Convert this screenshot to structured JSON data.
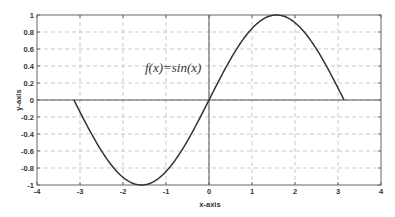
{
  "chart_data": {
    "type": "line",
    "title": "",
    "xlabel": "x-axis",
    "ylabel": "y-axis",
    "xlim": [
      -4,
      4
    ],
    "ylim": [
      -1,
      1
    ],
    "xticks": [
      -4,
      -3,
      -2,
      -1,
      0,
      1,
      2,
      3,
      4
    ],
    "xtick_labels": [
      "-4",
      "-3",
      "-2",
      "-1",
      "0",
      "1",
      "2",
      "3",
      "4"
    ],
    "yticks": [
      -1,
      -0.8,
      -0.6,
      -0.4,
      -0.2,
      0,
      0.2,
      0.4,
      0.6,
      0.8,
      1
    ],
    "ytick_labels": [
      "-1",
      "-0.8",
      "-0.6",
      "-0.4",
      "-0.2",
      "0",
      "0.2",
      "0.4",
      "0.6",
      "0.8",
      "1"
    ],
    "grid": true,
    "grid_style": "dashed",
    "legend": null,
    "annotations": [
      {
        "text": "f(x)=sin(x)",
        "x": -1.5,
        "y": 0.55
      }
    ],
    "series": [
      {
        "name": "f(x)=sin(x)",
        "function": "sin(x)",
        "x_range": [
          -3.1416,
          3.1416
        ],
        "color": "#333333",
        "x": [
          -3.1416,
          -2.5,
          -2.0,
          -1.5708,
          -1.0,
          -0.5,
          0,
          0.5,
          1.0,
          1.5708,
          2.0,
          2.5,
          3.1416
        ],
        "y": [
          0,
          -0.598,
          -0.909,
          -1,
          -0.841,
          -0.479,
          0,
          0.479,
          0.841,
          1,
          0.909,
          0.598,
          0
        ]
      }
    ],
    "axis_lines": {
      "x_zero": true,
      "y_zero": true
    }
  },
  "labels": {
    "xlabel": "x-axis",
    "ylabel": "y-axis",
    "annotation": "f(x)=sin(x)"
  }
}
